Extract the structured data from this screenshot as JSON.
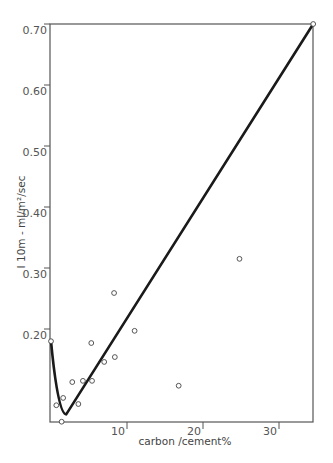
{
  "chart_data": {
    "type": "scatter",
    "title": "",
    "xlabel": "carbon /cement%",
    "ylabel": "I 10m - ml/m²/sec",
    "xlim": [
      0,
      34.5
    ],
    "ylim": [
      0.05,
      0.7
    ],
    "grid": false,
    "legend": null,
    "x_ticks": [
      {
        "value": 10,
        "label": "10"
      },
      {
        "value": 20,
        "label": "20"
      },
      {
        "value": 30,
        "label": "30"
      }
    ],
    "y_ticks": [
      {
        "value": 0.2,
        "label": "0.20"
      },
      {
        "value": 0.3,
        "label": "0.30"
      },
      {
        "value": 0.4,
        "label": "0.40"
      },
      {
        "value": 0.5,
        "label": "0.50"
      },
      {
        "value": 0.6,
        "label": "0.60"
      },
      {
        "value": 0.7,
        "label": "0.70"
      }
    ],
    "series": [
      {
        "name": "measured",
        "kind": "scatter",
        "marker": "open-circle",
        "points": [
          {
            "x": 0.0,
            "y": 0.18
          },
          {
            "x": 0.7,
            "y": 0.075
          },
          {
            "x": 1.6,
            "y": 0.087
          },
          {
            "x": 1.4,
            "y": 0.048
          },
          {
            "x": 2.8,
            "y": 0.113
          },
          {
            "x": 3.6,
            "y": 0.077
          },
          {
            "x": 4.2,
            "y": 0.115
          },
          {
            "x": 5.4,
            "y": 0.115
          },
          {
            "x": 5.3,
            "y": 0.177
          },
          {
            "x": 7.0,
            "y": 0.146
          },
          {
            "x": 8.4,
            "y": 0.154
          },
          {
            "x": 8.3,
            "y": 0.259
          },
          {
            "x": 11.0,
            "y": 0.197
          },
          {
            "x": 16.8,
            "y": 0.107
          },
          {
            "x": 24.8,
            "y": 0.315
          },
          {
            "x": 34.5,
            "y": 0.7
          }
        ]
      },
      {
        "name": "fitted curve",
        "kind": "line",
        "color": "#1a1a1a",
        "points": [
          {
            "x": 0.0,
            "y": 0.18
          },
          {
            "x": 0.6,
            "y": 0.13
          },
          {
            "x": 1.2,
            "y": 0.08
          },
          {
            "x": 2.0,
            "y": 0.06
          },
          {
            "x": 34.5,
            "y": 0.7
          }
        ]
      }
    ]
  },
  "plot": {
    "left": 50,
    "right": 313,
    "top": 24,
    "bottom": 422,
    "x_px_per_unit": 7.6,
    "x_origin_px": 51,
    "y_px_per_unit": 610,
    "y_ref_value": 0.7,
    "y_ref_px": 24
  },
  "colors": {
    "axis": "#555555",
    "curve": "#1a1a1a",
    "marker": "#444444",
    "ylabel_mark": "#4a4aa0"
  }
}
